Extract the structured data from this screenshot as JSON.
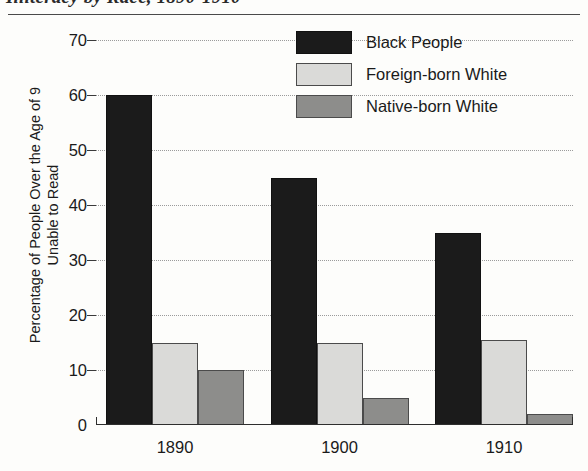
{
  "chart_data": {
    "type": "bar",
    "title": "Illiteracy by Race, 1890-1910",
    "xlabel": "",
    "ylabel_lines": [
      "Percentage of People Over the  Age of 9",
      "Unable to Read"
    ],
    "categories": [
      "1890",
      "1900",
      "1910"
    ],
    "series": [
      {
        "name": "Black People",
        "color": "#1b1b1b",
        "values": [
          60,
          45,
          35
        ]
      },
      {
        "name": "Foreign-born White",
        "color": "#dadad8",
        "values": [
          15,
          15,
          15.5
        ]
      },
      {
        "name": "Native-born White",
        "color": "#8d8d8b",
        "values": [
          10,
          5,
          2
        ]
      }
    ],
    "ylim": [
      0,
      70
    ],
    "yticks": [
      0,
      10,
      20,
      30,
      40,
      50,
      60,
      70
    ],
    "ytick_labels": [
      "0",
      "10",
      "20",
      "30",
      "40",
      "50",
      "60",
      "70"
    ],
    "grid": true,
    "legend_position": "top-right"
  }
}
